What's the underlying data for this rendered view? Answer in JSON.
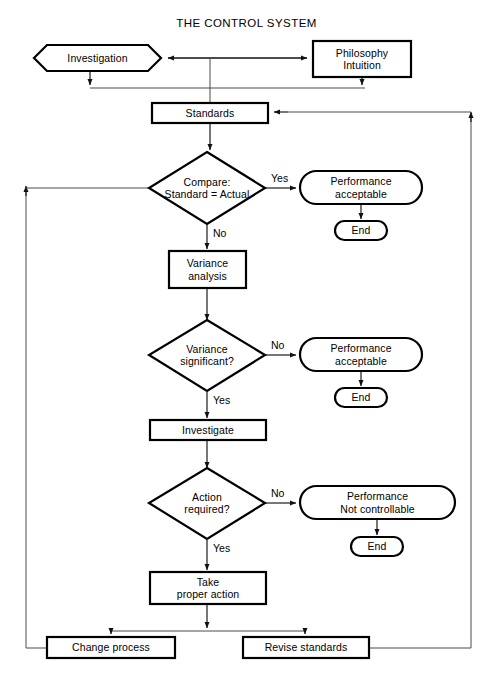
{
  "diagram": {
    "title": "THE CONTROL SYSTEM",
    "nodes": {
      "investigation": {
        "label": "Investigation",
        "shape": "hexagon"
      },
      "philosophy": {
        "label_line1": "Philosophy",
        "label_line2": "Intuition",
        "shape": "rectangle"
      },
      "standards": {
        "label": "Standards",
        "shape": "rectangle"
      },
      "compare": {
        "label_line1": "Compare:",
        "label_line2": "Standard = Actual",
        "shape": "diamond"
      },
      "performance_acceptable_1": {
        "label_line1": "Performance",
        "label_line2": "acceptable",
        "shape": "stadium"
      },
      "end_1": {
        "label": "End",
        "shape": "stadium"
      },
      "variance_analysis": {
        "label_line1": "Variance",
        "label_line2": "analysis",
        "shape": "rectangle"
      },
      "variance_significant": {
        "label_line1": "Variance",
        "label_line2": "significant?",
        "shape": "diamond"
      },
      "performance_acceptable_2": {
        "label_line1": "Performance",
        "label_line2": "acceptable",
        "shape": "stadium"
      },
      "end_2": {
        "label": "End",
        "shape": "stadium"
      },
      "investigate": {
        "label": "Investigate",
        "shape": "rectangle"
      },
      "action_required": {
        "label_line1": "Action",
        "label_line2": "required?",
        "shape": "diamond"
      },
      "performance_not_controllable": {
        "label_line1": "Performance",
        "label_line2": "Not controllable",
        "shape": "stadium"
      },
      "end_3": {
        "label": "End",
        "shape": "stadium"
      },
      "take_proper_action": {
        "label_line1": "Take",
        "label_line2": "proper action",
        "shape": "rectangle"
      },
      "change_process": {
        "label": "Change process",
        "shape": "rectangle"
      },
      "revise_standards": {
        "label": "Revise standards",
        "shape": "rectangle"
      }
    },
    "edge_labels": {
      "compare_yes": "Yes",
      "compare_no": "No",
      "variance_no": "No",
      "variance_yes": "Yes",
      "action_no": "No",
      "action_yes": "Yes"
    },
    "colors": {
      "stroke": "#000000",
      "connector": "#4a4a4a",
      "background": "#ffffff"
    }
  }
}
